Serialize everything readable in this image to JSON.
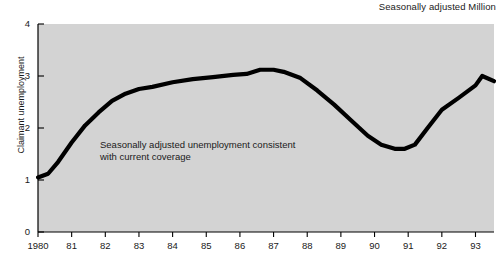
{
  "header": {
    "note": "Seasonally adjusted Million"
  },
  "annotation": {
    "line1": "Seasonally adjusted unemployment consistent",
    "line2": "with current coverage"
  },
  "colors": {
    "plot_background": "#d3d3d3",
    "line": "#000000",
    "axis": "#000000",
    "text": "#1a1a1a",
    "page_background": "#ffffff"
  },
  "chart_data": {
    "type": "line",
    "title": "",
    "subtitle": "",
    "xlabel": "",
    "ylabel": "Claimant unemployment",
    "unit_note": "Seasonally adjusted Million",
    "annotation": "Seasonally adjusted unemployment consistent with current coverage",
    "xlim": [
      1980,
      1993.55
    ],
    "ylim": [
      0,
      4
    ],
    "yticks": [
      0,
      1,
      2,
      3,
      4
    ],
    "ytick_labels": [
      "0",
      "1",
      "2",
      "3",
      "4"
    ],
    "xticks": [
      1980,
      1981,
      1982,
      1983,
      1984,
      1985,
      1986,
      1987,
      1988,
      1989,
      1990,
      1991,
      1992,
      1993
    ],
    "xtick_labels": [
      "1980",
      "81",
      "82",
      "83",
      "84",
      "85",
      "86",
      "87",
      "88",
      "89",
      "90",
      "91",
      "92",
      "93"
    ],
    "grid": false,
    "legend": false,
    "series": [
      {
        "name": "Claimant unemployment",
        "x": [
          1980.0,
          1980.3,
          1980.6,
          1981.0,
          1981.4,
          1981.8,
          1982.2,
          1982.6,
          1983.0,
          1983.4,
          1984.0,
          1984.6,
          1985.2,
          1985.8,
          1986.2,
          1986.6,
          1987.0,
          1987.3,
          1987.8,
          1988.3,
          1988.8,
          1989.3,
          1989.8,
          1990.2,
          1990.6,
          1990.9,
          1991.2,
          1991.6,
          1992.0,
          1992.5,
          1993.0,
          1993.2,
          1993.55
        ],
        "y": [
          1.05,
          1.12,
          1.35,
          1.72,
          2.05,
          2.3,
          2.52,
          2.66,
          2.75,
          2.79,
          2.88,
          2.94,
          2.98,
          3.02,
          3.04,
          3.12,
          3.12,
          3.08,
          2.96,
          2.72,
          2.45,
          2.15,
          1.85,
          1.68,
          1.6,
          1.6,
          1.68,
          2.02,
          2.35,
          2.58,
          2.82,
          3.0,
          2.9
        ]
      }
    ]
  }
}
